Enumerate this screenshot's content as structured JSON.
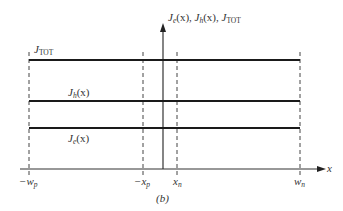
{
  "figure": {
    "caption": "(b)",
    "y_axis_label": {
      "je": "J",
      "je_sub": "e",
      "je_arg": "(x), ",
      "jh": "J",
      "jh_sub": "h",
      "jh_arg": "(x), ",
      "jtot": "J",
      "jtot_sub": "TOT"
    },
    "x_axis_label": "x",
    "curves": [
      {
        "name": "J_TOT",
        "label": "J",
        "sub": "TOT",
        "arg": "",
        "y_px": 60
      },
      {
        "name": "J_h(x)",
        "label": "J",
        "sub": "h",
        "arg": "(x)",
        "y_px": 101
      },
      {
        "name": "J_e(x)",
        "label": "J",
        "sub": "e",
        "arg": "(x)",
        "y_px": 128
      }
    ],
    "x_ticks": [
      {
        "label": "−w",
        "sub": "p",
        "x_px": 29
      },
      {
        "label": "−x",
        "sub": "p",
        "x_px": 143
      },
      {
        "label": "x",
        "sub": "n",
        "x_px": 177
      },
      {
        "label": "w",
        "sub": "n",
        "x_px": 300
      }
    ],
    "colors": {
      "line": "#1a1a1a",
      "dashed": "#444444",
      "axis": "#333333"
    }
  }
}
